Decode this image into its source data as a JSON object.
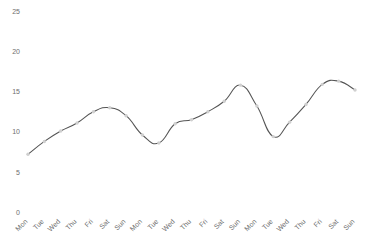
{
  "chart_data": {
    "type": "line",
    "title": "",
    "subtitle": "",
    "xlabel": "",
    "ylabel": "",
    "ylim": [
      0,
      25
    ],
    "yticks": [
      0,
      5,
      10,
      15,
      20,
      25
    ],
    "ytick_labels": [
      "0",
      "5",
      "10",
      "15",
      "20",
      "25"
    ],
    "grid": false,
    "legend": false,
    "legend_position": "none",
    "marker_style": "circle",
    "line_style": "smooth-spline",
    "line_color": "#545454",
    "marker_color": "#cfcfcf",
    "background_color": "#ffffff",
    "axis_label_color": "#6e6e6e",
    "categories": [
      "Mon",
      "Tue",
      "Wed",
      "Thu",
      "Fri",
      "Sat",
      "Sun",
      "Mon",
      "Tue",
      "Wed",
      "Thu",
      "Fri",
      "Sat",
      "Sun",
      "Mon",
      "Tue",
      "Wed",
      "Thu",
      "Fri",
      "Sat",
      "Sun"
    ],
    "series": [
      {
        "name": "value",
        "values": [
          7.3,
          8.9,
          10.2,
          11.2,
          12.6,
          13.1,
          12.1,
          9.7,
          8.7,
          11.1,
          11.6,
          12.6,
          13.9,
          15.9,
          13.3,
          9.5,
          11.3,
          13.5,
          16.0,
          16.4,
          15.3
        ]
      }
    ]
  }
}
